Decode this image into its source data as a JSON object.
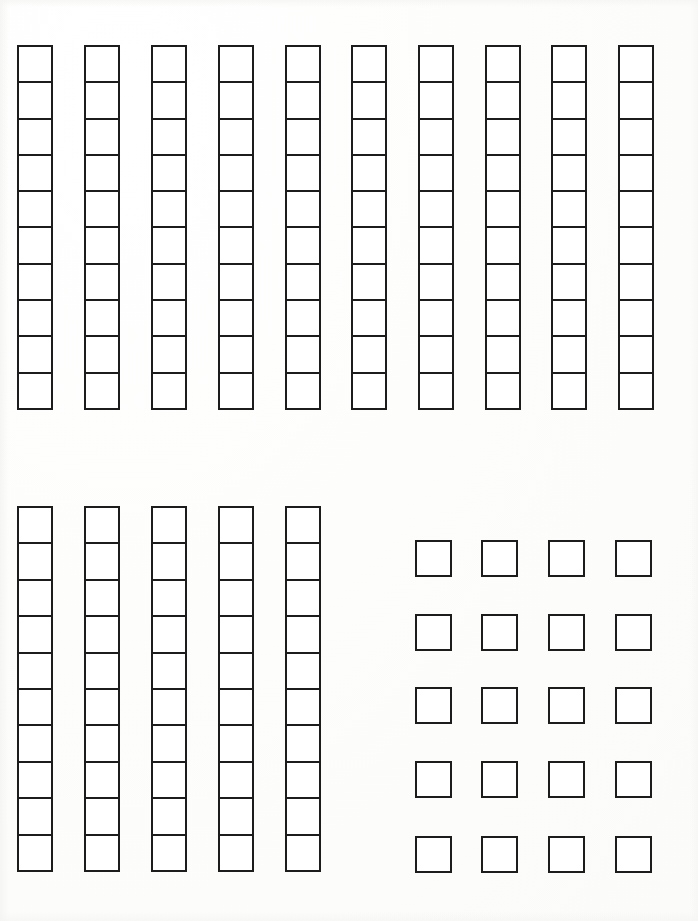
{
  "page": {
    "width": 698,
    "height": 921,
    "background_color": "#fefefe",
    "ink_color": "#1c1c1c",
    "line_width_px": 2.6
  },
  "chart_data": {
    "type": "table",
    "xlabel": "",
    "ylabel": "",
    "grid": false,
    "legend": null,
    "groups": [
      {
        "name": "top-rod-row",
        "label": "Top row of ten rods",
        "shape": "vertical-rods",
        "rod_count": 10,
        "units_per_rod": 10,
        "total_units": 100,
        "origin_x": 17,
        "origin_y": 45,
        "rod_width": 36,
        "rod_height": 365,
        "column_pitch": 66.8,
        "rods": [
          {
            "index": 1,
            "x": 17,
            "units": 10
          },
          {
            "index": 2,
            "x": 84,
            "units": 10
          },
          {
            "index": 3,
            "x": 151,
            "units": 10
          },
          {
            "index": 4,
            "x": 218,
            "units": 10
          },
          {
            "index": 5,
            "x": 285,
            "units": 10
          },
          {
            "index": 6,
            "x": 351,
            "units": 10
          },
          {
            "index": 7,
            "x": 418,
            "units": 10
          },
          {
            "index": 8,
            "x": 485,
            "units": 10
          },
          {
            "index": 9,
            "x": 551,
            "units": 10
          },
          {
            "index": 10,
            "x": 618,
            "units": 10
          }
        ]
      },
      {
        "name": "bottom-left-rod-row",
        "label": "Bottom-left group of five rods",
        "shape": "vertical-rods",
        "rod_count": 5,
        "units_per_rod": 10,
        "total_units": 50,
        "origin_x": 17,
        "origin_y": 506,
        "rod_width": 36,
        "rod_height": 366,
        "column_pitch": 66.8,
        "rods": [
          {
            "index": 1,
            "x": 17,
            "units": 10
          },
          {
            "index": 2,
            "x": 84,
            "units": 10
          },
          {
            "index": 3,
            "x": 151,
            "units": 10
          },
          {
            "index": 4,
            "x": 218,
            "units": 10
          },
          {
            "index": 5,
            "x": 285,
            "units": 10
          }
        ]
      },
      {
        "name": "bottom-right-unit-grid",
        "label": "Bottom-right grid of single unit squares",
        "shape": "separated-unit-grid",
        "columns": 4,
        "rows": 5,
        "total_units": 20,
        "unit_size": 37,
        "column_x": [
          415,
          481,
          548,
          615
        ],
        "row_y": [
          540,
          614,
          687,
          761,
          836
        ],
        "column_pitch": 66.7,
        "row_pitch": 74
      }
    ],
    "totals": {
      "rods": 15,
      "rod_units": 150,
      "single_units": 20,
      "grand_total_units": 170
    }
  }
}
